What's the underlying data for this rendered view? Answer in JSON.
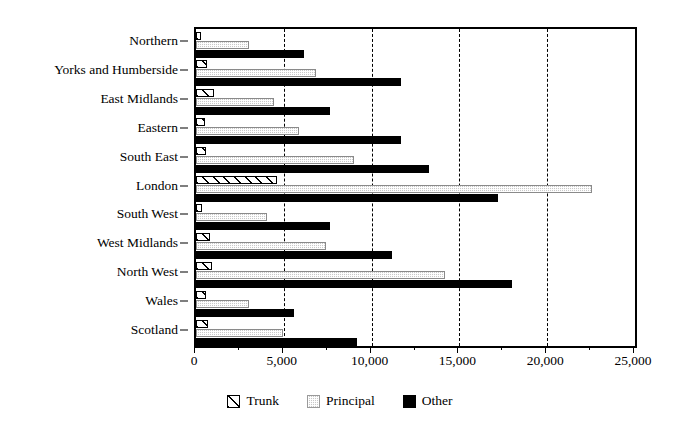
{
  "chart_data": {
    "type": "bar",
    "orientation": "horizontal",
    "title": "",
    "subtitle": "",
    "xlabel": "",
    "ylabel": "",
    "xlim": [
      0,
      25000
    ],
    "ylim": null,
    "grid": "vertical-dashed-at-major-x-ticks",
    "legend_position": "bottom-center",
    "categories": [
      "Northern",
      "Yorks and Humberside",
      "East Midlands",
      "Eastern",
      "South East",
      "London",
      "South West",
      "West Midlands",
      "North West",
      "Wales",
      "Scotland"
    ],
    "series": [
      {
        "name": "Trunk",
        "fill": "diagonal-hatch",
        "color": "#ffffff",
        "values": [
          300,
          630,
          1000,
          520,
          560,
          4610,
          330,
          800,
          900,
          570,
          680
        ]
      },
      {
        "name": "Principal",
        "fill": "gray-stipple",
        "color": "#c9c9c9",
        "values": [
          3020,
          6830,
          4440,
          5870,
          9000,
          22550,
          4040,
          7400,
          14180,
          3020,
          4960
        ]
      },
      {
        "name": "Other",
        "fill": "solid",
        "color": "#000000",
        "values": [
          6150,
          11670,
          7630,
          11670,
          13270,
          17200,
          7630,
          11160,
          18000,
          5580,
          9170
        ]
      }
    ],
    "x_ticks_major": [
      0,
      5000,
      10000,
      15000,
      20000,
      25000
    ],
    "x_tick_labels": [
      "0",
      "5,000",
      "10,000",
      "15,000",
      "20,000",
      "25,000"
    ],
    "x_ticks_minor": [
      2500,
      7500,
      12500,
      17500,
      22500
    ]
  },
  "legend": {
    "entries": [
      {
        "label": "Trunk",
        "swatch": "trunk-hatch-swatch"
      },
      {
        "label": "Principal",
        "swatch": "principal-stipple-swatch"
      },
      {
        "label": "Other",
        "swatch": "other-solid-swatch"
      }
    ]
  }
}
